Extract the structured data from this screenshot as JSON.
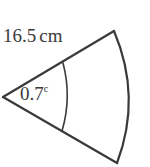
{
  "figure": {
    "kind": "circular-sector-diagram",
    "background_color": "#ffffff",
    "stroke_color": "#3a3a3a",
    "text_color": "#3a3a3a",
    "radius_label": {
      "value": "16.5",
      "unit": "cm",
      "full_text": "16.5 cm"
    },
    "angle_label": {
      "value": "0.7",
      "superscript": "c",
      "full_text": "0.7c"
    },
    "geometry": {
      "vertex": [
        3,
        97
      ],
      "top_arc_end": [
        114,
        31
      ],
      "bottom_arc_end": [
        117,
        163
      ],
      "outer_arc_extreme": [
        139,
        97
      ],
      "angle_arc_start": [
        63,
        63
      ],
      "angle_arc_end": [
        62,
        131
      ],
      "angle_arc_extreme": [
        71,
        97
      ],
      "stroke_width": 2.2
    }
  }
}
